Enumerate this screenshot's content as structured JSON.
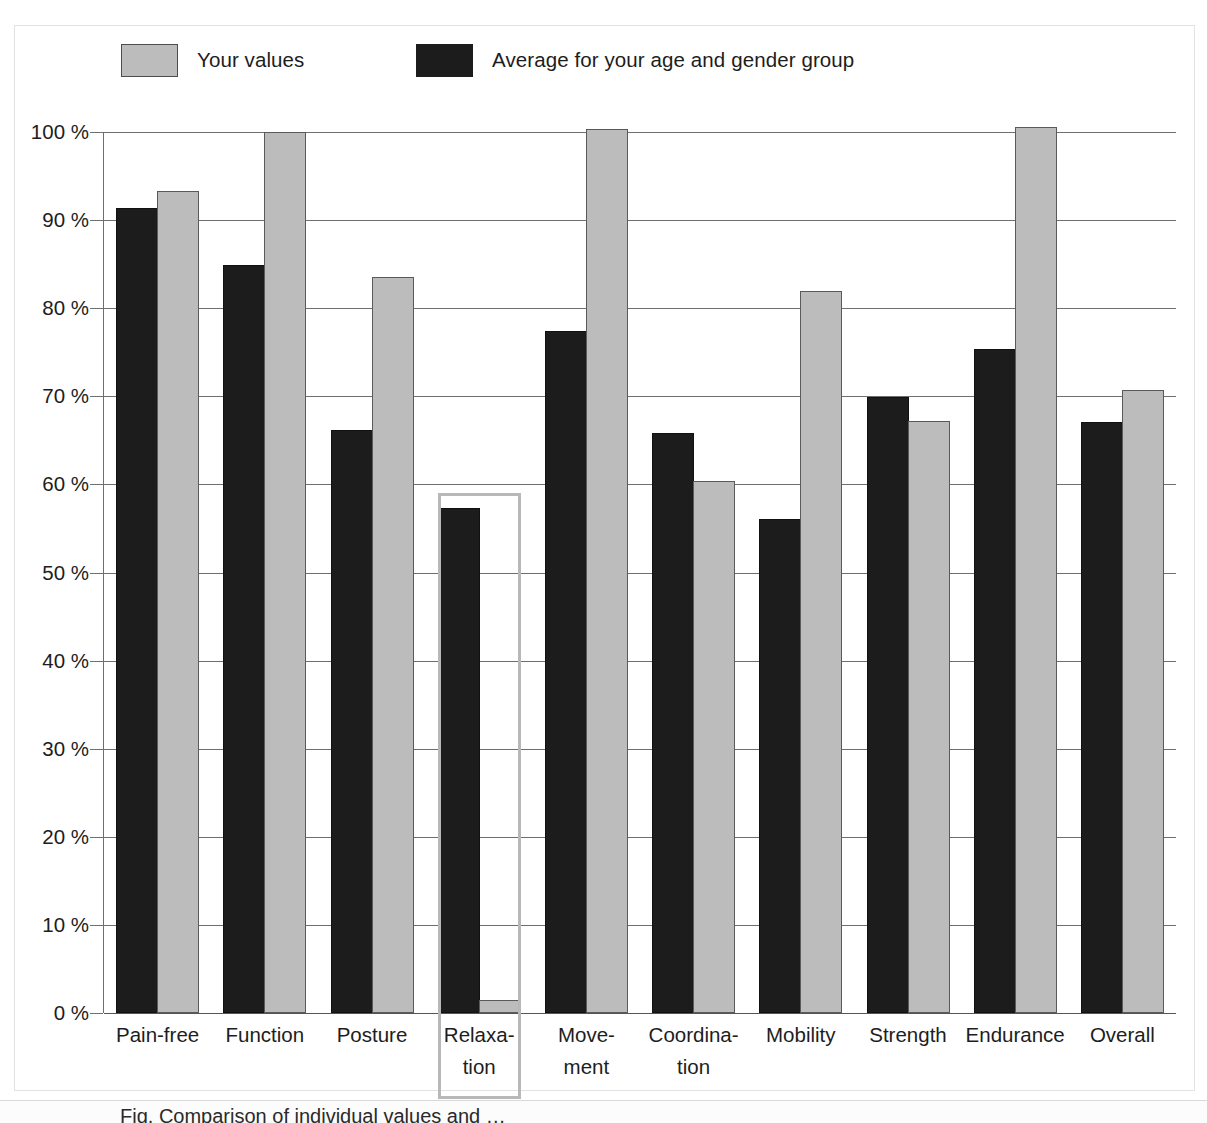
{
  "legend": {
    "entries": [
      {
        "label": "Your values",
        "color": "#bcbcbc",
        "swatch_icon": "legend-swatch-gray"
      },
      {
        "label": "Average for your age and gender group",
        "color": "#1c1c1c",
        "swatch_icon": "legend-swatch-black"
      }
    ]
  },
  "caption": {
    "text": "Fig. Comparison of individual values and …"
  },
  "highlight": {
    "category": "Relaxation"
  },
  "chart_data": {
    "type": "bar",
    "title": "",
    "subtitle": "",
    "xlabel": "",
    "ylabel": "",
    "ylim": [
      0,
      100
    ],
    "yticks": [
      0,
      10,
      20,
      30,
      40,
      50,
      60,
      70,
      80,
      90,
      100
    ],
    "ytick_labels": [
      "0 %",
      "10 %",
      "20 %",
      "30 %",
      "40 %",
      "50 %",
      "60 %",
      "70 %",
      "80 %",
      "90 %",
      "100 %"
    ],
    "grid": true,
    "legend_position": "top-left",
    "categories": [
      "Pain-free",
      "Function",
      "Posture",
      "Relaxa-\ntion",
      "Move-\nment",
      "Coordina-\ntion",
      "Mobility",
      "Strength",
      "Endurance",
      "Overall"
    ],
    "series": [
      {
        "name": "Average for your age and gender group",
        "color": "#1c1c1c",
        "values": [
          91.4,
          84.9,
          66.2,
          57.3,
          77.4,
          65.8,
          56.1,
          69.9,
          75.4,
          67.1
        ]
      },
      {
        "name": "Your values",
        "color": "#bcbcbc",
        "values": [
          93.3,
          100.0,
          83.5,
          1.5,
          100.3,
          60.4,
          81.9,
          67.2,
          100.6,
          70.7
        ]
      }
    ]
  }
}
